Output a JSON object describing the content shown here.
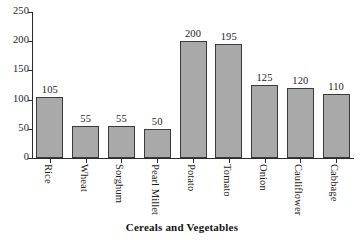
{
  "chart_data": {
    "type": "bar",
    "title": "",
    "xlabel": "Cereals and Vegetables",
    "ylabel": "",
    "categories": [
      "Rice",
      "Wheat",
      "Sorghum",
      "Pearl Millet",
      "Potato",
      "Tomato",
      "Onion",
      "Cauliflower",
      "Cabbage"
    ],
    "values": [
      105,
      55,
      55,
      50,
      200,
      195,
      125,
      120,
      110
    ],
    "data_labels": [
      "105",
      "55",
      "55",
      "50",
      "200",
      "195",
      "125",
      "120",
      "110"
    ],
    "ylim": [
      0,
      250
    ],
    "y_ticks": [
      0,
      50,
      100,
      150,
      200,
      250
    ],
    "y_tick_labels": [
      "0",
      "50",
      "100",
      "150",
      "200",
      "250"
    ],
    "grid": false,
    "legend": false,
    "bar_color": "#a9a9a9",
    "bar_edge_color": "#3a3a3a",
    "axis_color": "#2b2b2b",
    "background_color": "#ffffff",
    "label_orientation": "vertical"
  }
}
